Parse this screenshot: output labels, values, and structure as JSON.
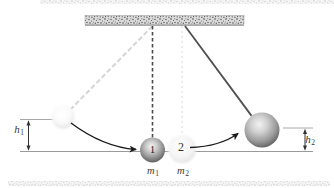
{
  "figure": {
    "ball1_label": "1",
    "ball2_label": "2",
    "mass1": {
      "base": "m",
      "sub": "1"
    },
    "mass2": {
      "base": "m",
      "sub": "2"
    },
    "height1": {
      "base": "h",
      "sub": "1"
    },
    "height2": {
      "base": "h",
      "sub": "2"
    },
    "colors": {
      "background": "#ffffff",
      "ceiling_base": "#dcdcdc",
      "ceiling_speckle": "#4a4a4a",
      "ceiling_underline": "#8a8a8a",
      "string_dark_dashed": "#4a4a4a",
      "string_swung_solid": "#4f4f4f",
      "string_ghost_diagonal": "#d5d5d5",
      "string_ghost_vertical": "#e6e6e6",
      "ground_line": "#9b9b9b",
      "reference_line": "#a8a8a8",
      "dimension_arrow": "#333333",
      "swing_arrow": "#1a1a1a",
      "label_text": "#3a3a3a",
      "scan_artifact": "#c9c9c9"
    }
  }
}
